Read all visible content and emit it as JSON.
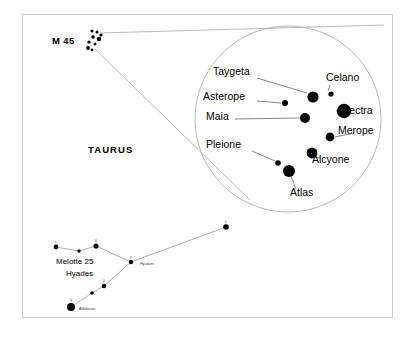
{
  "figure": {
    "title_visible": false,
    "background_color": "#ffffff",
    "frame_color": "#cccccc",
    "width": 414,
    "height": 340
  },
  "labels": {
    "m45": "M 45",
    "taurus": "TAURUS",
    "melotte": "Melotte 25",
    "hyades": "Hyades",
    "aldebaran": "Aldebaran",
    "hyadum": "Hyadum"
  },
  "chart_data": {
    "type": "scatter",
    "xlabel": "",
    "ylabel": "",
    "grid": false,
    "legend": false,
    "annotations": [
      "M 45",
      "TAURUS",
      "Melotte 25",
      "Hyades",
      "Aldebaran",
      "Hyadum"
    ],
    "series": [
      {
        "name": "Pleiades magnified view",
        "marker": "filled-circle",
        "color": "#000000",
        "points": [
          {
            "label": "Taygeta",
            "x": 313,
            "y": 97,
            "size": 5.6
          },
          {
            "label": "Celano",
            "x": 331,
            "y": 94,
            "size": 2.6
          },
          {
            "label": "Asterope",
            "x": 285,
            "y": 103,
            "size": 3.0
          },
          {
            "label": "Electra",
            "x": 344,
            "y": 111,
            "size": 7.2
          },
          {
            "label": "Maia",
            "x": 305,
            "y": 118,
            "size": 5.0
          },
          {
            "label": "Merope",
            "x": 330,
            "y": 137,
            "size": 4.4
          },
          {
            "label": "Alcyone",
            "x": 312,
            "y": 153,
            "size": 5.4
          },
          {
            "label": "Pleione",
            "x": 278,
            "y": 163,
            "size": 2.8
          },
          {
            "label": "Atlas",
            "x": 289,
            "y": 171,
            "size": 6.0
          }
        ]
      },
      {
        "name": "M 45 cluster (wide field)",
        "marker": "filled-circle",
        "color": "#000000",
        "points": [
          {
            "label": "",
            "x": 92,
            "y": 31,
            "size": 1.5
          },
          {
            "label": "",
            "x": 97,
            "y": 32,
            "size": 1.5
          },
          {
            "label": "",
            "x": 101,
            "y": 35,
            "size": 1.6
          },
          {
            "label": "",
            "x": 93,
            "y": 37,
            "size": 1.8
          },
          {
            "label": "",
            "x": 99,
            "y": 39,
            "size": 2.2
          },
          {
            "label": "",
            "x": 89,
            "y": 42,
            "size": 1.6
          },
          {
            "label": "",
            "x": 95,
            "y": 44,
            "size": 1.5
          },
          {
            "label": "",
            "x": 88,
            "y": 48,
            "size": 1.9
          },
          {
            "label": "",
            "x": 92,
            "y": 50,
            "size": 1.4
          }
        ]
      },
      {
        "name": "Hyades (Melotte 25)",
        "marker": "filled-circle",
        "color": "#000000",
        "points": [
          {
            "label": "ε",
            "x": 56,
            "y": 247,
            "size": 2.4
          },
          {
            "label": "",
            "x": 79,
            "y": 251,
            "size": 1.7
          },
          {
            "label": "δ",
            "x": 96,
            "y": 246,
            "size": 2.6
          },
          {
            "label": "γ",
            "x": 131,
            "y": 262,
            "size": 2.3
          },
          {
            "label": "θ",
            "x": 104,
            "y": 286,
            "size": 2.3
          },
          {
            "label": "",
            "x": 92,
            "y": 293,
            "size": 1.8
          },
          {
            "label": "α",
            "x": 71,
            "y": 307,
            "size": 4.0
          },
          {
            "label": "ζ",
            "x": 226,
            "y": 227,
            "size": 2.8
          }
        ],
        "connections": [
          [
            56,
            247,
            79,
            251
          ],
          [
            79,
            251,
            96,
            246
          ],
          [
            96,
            246,
            131,
            262
          ],
          [
            131,
            262,
            226,
            227
          ],
          [
            131,
            262,
            104,
            286
          ],
          [
            104,
            286,
            92,
            293
          ],
          [
            92,
            293,
            71,
            307
          ]
        ]
      }
    ],
    "magnifier": {
      "center_x": 288,
      "center_y": 119,
      "radius": 93,
      "source_x": 95,
      "source_y": 40
    }
  },
  "stars": [
    {
      "name": "Taygeta",
      "label_x": 213,
      "label_y": 75,
      "anchor": "start",
      "lx1": 257,
      "ly1": 78,
      "lx2": 307,
      "ly2": 93
    },
    {
      "name": "Celano",
      "label_x": 326,
      "label_y": 81,
      "anchor": "start",
      "lx1": 330,
      "ly1": 85,
      "lx2": 328,
      "ly2": 91
    },
    {
      "name": "Asterope",
      "label_x": 203,
      "label_y": 100,
      "anchor": "start",
      "lx1": 257,
      "ly1": 101,
      "lx2": 281,
      "ly2": 103
    },
    {
      "name": "Electra",
      "label_x": 340,
      "label_y": 114,
      "anchor": "start",
      "lx1": 352,
      "ly1": 111,
      "lx2": 336,
      "ly2": 111
    },
    {
      "name": "Maia",
      "label_x": 206,
      "label_y": 120,
      "anchor": "start",
      "lx1": 235,
      "ly1": 119,
      "lx2": 300,
      "ly2": 118
    },
    {
      "name": "Merope",
      "label_x": 338,
      "label_y": 134,
      "anchor": "start",
      "lx1": 354,
      "ly1": 133,
      "lx2": 335,
      "ly2": 137
    },
    {
      "name": "Pleione",
      "label_x": 206,
      "label_y": 148,
      "anchor": "start",
      "lx1": 252,
      "ly1": 151,
      "lx2": 275,
      "ly2": 161
    },
    {
      "name": "Alcyone",
      "label_x": 312,
      "label_y": 163,
      "anchor": "start",
      "lx1": 320,
      "ly1": 158,
      "lx2": 314,
      "ly2": 157
    },
    {
      "name": "Atlas",
      "label_x": 290,
      "label_y": 196,
      "anchor": "start",
      "lx1": 296,
      "ly1": 189,
      "lx2": 291,
      "ly2": 176
    }
  ]
}
